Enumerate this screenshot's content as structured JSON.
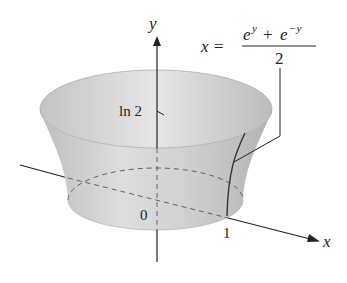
{
  "diagram": {
    "type": "surface-of-revolution",
    "axes": {
      "x_label": "x",
      "y_label": "y"
    },
    "ticks": {
      "origin": "0",
      "x_one": "1",
      "y_ln2": "ln 2"
    },
    "equation": {
      "lhs": "x =",
      "numerator_a": "e",
      "exp_a": "y",
      "plus": "+",
      "numerator_b": "e",
      "exp_b": "−y",
      "denominator": "2"
    },
    "colors": {
      "surface": "#c9c9c9",
      "rim": "#e2e2e2",
      "line": "#222222"
    }
  }
}
